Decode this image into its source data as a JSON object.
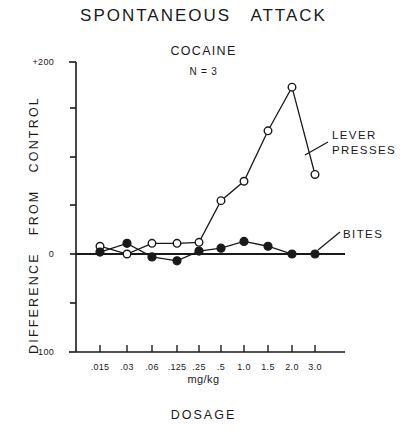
{
  "figure": {
    "title": "SPONTANEOUS   ATTACK",
    "drug": "COCAINE",
    "subjects": "N = 3",
    "ylabel": "DIFFERENCE   FROM   CONTROL",
    "xlabel_units": "mg/kg",
    "xlabel_main": "DOSAGE",
    "ink_color": "#1a1a1a",
    "background": "#ffffff"
  },
  "legend": {
    "lever_presses_line1": "LEVER",
    "lever_presses_line2": "PRESSES",
    "bites": "BITES"
  },
  "axes": {
    "y_tick_labels": [
      "+200",
      "0",
      "-100"
    ],
    "y_top_label": "+200",
    "y_zero_label": "0",
    "y_bottom_label": "-100",
    "x_tick_labels": [
      ".015",
      ".03",
      ".06",
      ".125",
      ".25",
      ".5",
      "1.0",
      "1.5",
      "2.0",
      "3.0"
    ]
  },
  "chart_data": {
    "type": "line",
    "title": "SPONTANEOUS   ATTACK",
    "subtitle": "COCAINE   N = 3",
    "xlabel": "DOSAGE (mg/kg)",
    "ylabel": "DIFFERENCE FROM CONTROL",
    "categories": [
      ".015",
      ".03",
      ".06",
      ".125",
      ".25",
      ".5",
      "1.0",
      "1.5",
      "2.0",
      "3.0"
    ],
    "x": [
      0.015,
      0.03,
      0.06,
      0.125,
      0.25,
      0.5,
      1.0,
      1.5,
      2.0,
      3.0
    ],
    "ylim": [
      -100,
      200
    ],
    "yticks": [
      -100,
      -50,
      0,
      50,
      100,
      150,
      200
    ],
    "ytick_labeled": [
      -100,
      0,
      200
    ],
    "grid": false,
    "legend_position": "right-inline-annotations",
    "series": [
      {
        "name": "LEVER PRESSES",
        "marker": "open-circle",
        "values": [
          8,
          0,
          11,
          11,
          12,
          55,
          75,
          127,
          172,
          82
        ]
      },
      {
        "name": "BITES",
        "marker": "filled-circle",
        "values": [
          2,
          11,
          -3,
          -7,
          3,
          6,
          13,
          8,
          0,
          0
        ]
      }
    ],
    "annotations": [
      {
        "text": "LEVER PRESSES",
        "points_to": "2.0 / 3.0 lever-press points"
      },
      {
        "text": "BITES",
        "points_to": "3.0 bites point"
      }
    ]
  }
}
